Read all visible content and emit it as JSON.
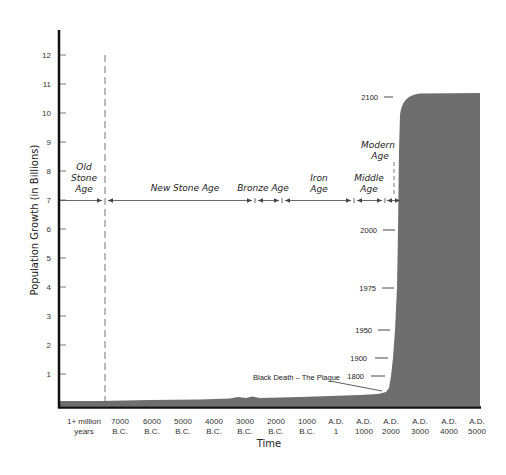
{
  "chart_data": {
    "type": "area",
    "title": "",
    "xlabel": "Time",
    "ylabel": "Population Growth (in Billions)",
    "ylim": [
      0,
      12.5
    ],
    "yticks": [
      1,
      2,
      3,
      4,
      5,
      6,
      7,
      8,
      9,
      10,
      11,
      12
    ],
    "grid": false,
    "fill_color": "#6e6e6e",
    "categories": [
      {
        "line1": "1+ million",
        "line2": "years"
      },
      {
        "line1": "7000",
        "line2": "B.C."
      },
      {
        "line1": "6000",
        "line2": "B.C."
      },
      {
        "line1": "5000",
        "line2": "B.C."
      },
      {
        "line1": "4000",
        "line2": "B.C."
      },
      {
        "line1": "3000",
        "line2": "B.C."
      },
      {
        "line1": "2000",
        "line2": "B.C."
      },
      {
        "line1": "1000",
        "line2": "B.C."
      },
      {
        "line1": "A.D.",
        "line2": "1"
      },
      {
        "line1": "A.D.",
        "line2": "1000"
      },
      {
        "line1": "A.D.",
        "line2": "2000"
      },
      {
        "line1": "A.D.",
        "line2": "3000"
      },
      {
        "line1": "A.D.",
        "line2": "4000"
      },
      {
        "line1": "A.D.",
        "line2": "5000"
      }
    ],
    "series": [
      {
        "name": "World population (billions)",
        "points": [
          {
            "x": "1+ million years",
            "y": 0.005
          },
          {
            "x": "7000 B.C.",
            "y": 0.01
          },
          {
            "x": "5000 B.C.",
            "y": 0.02
          },
          {
            "x": "3000 B.C.",
            "y": 0.05
          },
          {
            "x": "2000 B.C.",
            "y": 0.07
          },
          {
            "x": "1000 B.C.",
            "y": 0.1
          },
          {
            "x": "A.D. 1",
            "y": 0.2
          },
          {
            "x": "A.D. 1000",
            "y": 0.3
          },
          {
            "x": "A.D. 1800",
            "y": 1.0
          },
          {
            "x": "A.D. 1900",
            "y": 1.6
          },
          {
            "x": "A.D. 1950",
            "y": 2.5
          },
          {
            "x": "A.D. 1975",
            "y": 4.0
          },
          {
            "x": "A.D. 2000",
            "y": 6.0
          },
          {
            "x": "A.D. 2100",
            "y": 10.6
          },
          {
            "x": "A.D. 5000",
            "y": 10.7
          }
        ]
      }
    ],
    "year_markers": [
      {
        "label": "2100",
        "value": 10.6
      },
      {
        "label": "2000",
        "value": 6.0
      },
      {
        "label": "1975",
        "value": 4.0
      },
      {
        "label": "1950",
        "value": 2.5
      },
      {
        "label": "1900",
        "value": 1.6
      },
      {
        "label": "1800",
        "value": 1.0
      }
    ],
    "eras": [
      {
        "name": "Old Stone Age",
        "lines": [
          "Old",
          "Stone",
          "Age"
        ]
      },
      {
        "name": "New Stone Age",
        "lines": [
          "New Stone Age"
        ]
      },
      {
        "name": "Bronze Age",
        "lines": [
          "Bronze Age"
        ]
      },
      {
        "name": "Iron Age",
        "lines": [
          "Iron",
          "Age"
        ]
      },
      {
        "name": "Middle Age",
        "lines": [
          "Middle",
          "Age"
        ]
      },
      {
        "name": "Modern Age",
        "lines": [
          "Modern",
          "Age"
        ]
      }
    ],
    "era_arrow_level": 7,
    "annotations": [
      {
        "text": "Black Death – The Plague",
        "target": "A.D. 1350 dip"
      }
    ],
    "legend": null
  }
}
